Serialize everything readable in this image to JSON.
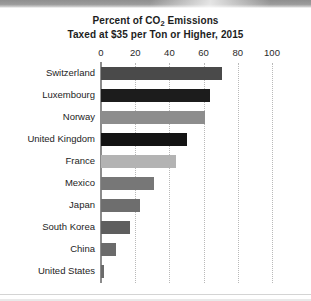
{
  "chart": {
    "title_line1_pre": "Percent of CO",
    "title_line1_sub": "2",
    "title_line1_post": " Emissions",
    "title_line2": "Taxed at $35 per Ton or Higher, 2015"
  },
  "chart_data": {
    "type": "bar",
    "orientation": "horizontal",
    "title": "Percent of CO2 Emissions Taxed at $35 per Ton or Higher, 2015",
    "xlabel": "",
    "ylabel": "",
    "xlim": [
      0,
      100
    ],
    "xticks": [
      0,
      20,
      40,
      60,
      80,
      100
    ],
    "xtick_labels": [
      "0",
      "20",
      "40",
      "60",
      "80",
      "100"
    ],
    "grid": "vertical-dotted",
    "legend": "none",
    "categories": [
      "Switzerland",
      "Luxembourg",
      "Norway",
      "United Kingdom",
      "France",
      "Mexico",
      "Japan",
      "South Korea",
      "China",
      "United States"
    ],
    "values": [
      71,
      64,
      61,
      50,
      44,
      31,
      23,
      17,
      9,
      2
    ],
    "bar_colors": [
      "#4a4a4a",
      "#1c1c1c",
      "#8d8d8d",
      "#141414",
      "#b3b3b3",
      "#777777",
      "#6e6e6e",
      "#5e5e5e",
      "#6b6b6b",
      "#6b6b6b"
    ]
  },
  "colors": {
    "background": "#ffffff",
    "axis": "#8c8c8c",
    "gridline": "#b9b9b9",
    "text": "#1d1d1d"
  }
}
